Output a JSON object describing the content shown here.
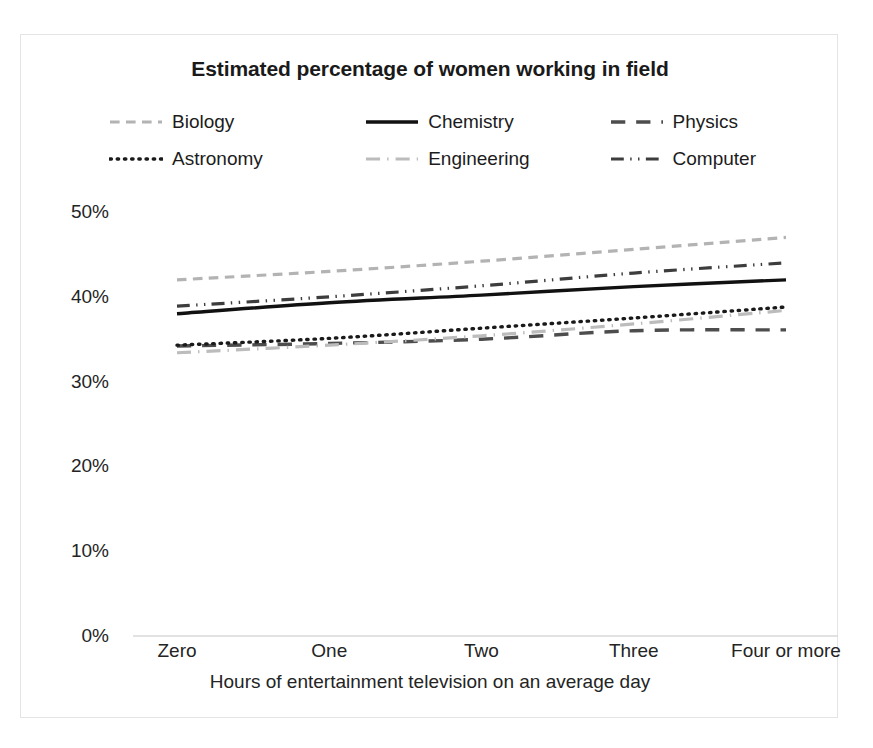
{
  "chart_data": {
    "type": "line",
    "title": "Estimated percentage of women working in field",
    "xlabel": "Hours of entertainment television on an average day",
    "ylabel": "",
    "categories": [
      "Zero",
      "One",
      "Two",
      "Three",
      "Four or more"
    ],
    "ylim": [
      0,
      50
    ],
    "yticks": [
      "0%",
      "10%",
      "20%",
      "30%",
      "40%",
      "50%"
    ],
    "ytick_values": [
      0,
      10,
      20,
      30,
      40,
      50
    ],
    "grid": false,
    "legend_position": "top",
    "value_suffix": "%",
    "series": [
      {
        "name": "Biology",
        "values": [
          42.0,
          43.0,
          44.2,
          45.6,
          47.0
        ],
        "color": "#b3b3b3",
        "dash": "dashed",
        "width": 3.2
      },
      {
        "name": "Chemistry",
        "values": [
          38.0,
          39.3,
          40.2,
          41.2,
          42.0
        ],
        "color": "#111111",
        "dash": "solid",
        "width": 3.4
      },
      {
        "name": "Physics",
        "values": [
          34.2,
          34.5,
          35.0,
          36.0,
          36.1
        ],
        "color": "#4d4d4d",
        "dash": "long-dash",
        "width": 3.4
      },
      {
        "name": "Astronomy",
        "values": [
          34.3,
          35.1,
          36.3,
          37.5,
          38.8
        ],
        "color": "#1a1a1a",
        "dash": "dotted",
        "width": 3.4
      },
      {
        "name": "Engineering",
        "values": [
          33.4,
          34.3,
          35.4,
          36.8,
          38.4
        ],
        "color": "#bcbcbc",
        "dash": "dash-dot",
        "width": 3.2
      },
      {
        "name": "Computer",
        "values": [
          38.9,
          40.0,
          41.3,
          42.8,
          44.0
        ],
        "color": "#3d3d3d",
        "dash": "dash-dot-dot",
        "width": 3.2
      }
    ]
  },
  "legend": {
    "rows": [
      [
        {
          "label": "Biology",
          "series": 0
        },
        {
          "label": "Chemistry",
          "series": 1
        },
        {
          "label": "Physics",
          "series": 2
        }
      ],
      [
        {
          "label": "Astronomy",
          "series": 3
        },
        {
          "label": "Engineering",
          "series": 4
        },
        {
          "label": "Computer",
          "series": 5
        }
      ]
    ]
  }
}
